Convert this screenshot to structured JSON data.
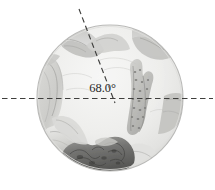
{
  "figure": {
    "type": "medical-endoscopic-illustration",
    "shape": "circular-field-of-view",
    "caption": "",
    "annotation": {
      "angle_label": "68.0°",
      "angle_value": 68.0,
      "angle_units": "degrees"
    },
    "geometry": {
      "circle_center_x": 110,
      "circle_center_y": 98,
      "circle_radius": 73,
      "vertex_x": 111,
      "vertex_y": 98,
      "horizontal_line_y": 98,
      "horizontal_line_x_start": 2,
      "horizontal_line_x_end": 213,
      "angled_line_top_x": 79,
      "angled_line_top_y": 9
    },
    "colors": {
      "background": "#ffffff",
      "field_fill": "#efefee",
      "field_edge": "#b9b9b7",
      "tissue_light": "#dcdcda",
      "tissue_mid": "#c3c3c0",
      "tissue_dark": "#8d8d8a",
      "tissue_darkest": "#5e5e5c",
      "speckle": "#8a8a87",
      "dash_line": "#4a4a48",
      "label_text": "#2a2a2a"
    },
    "regions": [
      {
        "name": "upper-left-flap",
        "tone": "tissue_mid"
      },
      {
        "name": "upper-right-flap",
        "tone": "tissue_mid"
      },
      {
        "name": "left-lateral-fold",
        "tone": "tissue_light"
      },
      {
        "name": "right-lateral-wedge",
        "tone": "tissue_mid"
      },
      {
        "name": "central-speckled-structure",
        "tone": "speckle"
      },
      {
        "name": "lower-dark-mass",
        "tone": "tissue_darkest"
      },
      {
        "name": "lower-left-lobes",
        "tone": "tissue_light"
      }
    ]
  }
}
